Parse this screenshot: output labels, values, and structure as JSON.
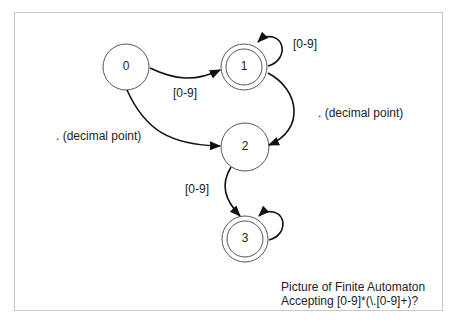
{
  "diagram": {
    "type": "finite-automaton",
    "states": [
      {
        "id": "0",
        "label": "0",
        "accepting": false,
        "start": true
      },
      {
        "id": "1",
        "label": "1",
        "accepting": true
      },
      {
        "id": "2",
        "label": "2",
        "accepting": false
      },
      {
        "id": "3",
        "label": "3",
        "accepting": true
      }
    ],
    "transitions": [
      {
        "from": "0",
        "to": "1",
        "label": "[0-9]"
      },
      {
        "from": "1",
        "to": "1",
        "label": "[0-9]"
      },
      {
        "from": "0",
        "to": "2",
        "label": ". (decimal point)"
      },
      {
        "from": "1",
        "to": "2",
        "label": ". (decimal point)"
      },
      {
        "from": "2",
        "to": "3",
        "label": "[0-9]"
      },
      {
        "from": "3",
        "to": "3",
        "label": ""
      }
    ],
    "caption": {
      "line1": "Picture of Finite Automaton",
      "line2": "Accepting [0-9]*(\\.[0-9]+)?"
    }
  }
}
